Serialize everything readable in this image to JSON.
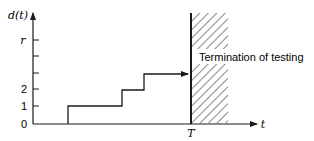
{
  "diagram": {
    "y_axis_label": "d(t)",
    "x_axis_label": "t",
    "y_ticks": [
      {
        "label": "r",
        "y": 40,
        "italic": true
      },
      {
        "label": "",
        "y": 56
      },
      {
        "label": "",
        "y": 73
      },
      {
        "label": "2",
        "y": 89
      },
      {
        "label": "1",
        "y": 106
      },
      {
        "label": "0",
        "y": 124
      }
    ],
    "termination_marker": "T",
    "annotation": "Termination of testing",
    "step_function": [
      {
        "x_start": 33,
        "x_end": 68,
        "level": 0
      },
      {
        "x_start": 68,
        "x_end": 122,
        "level": 1
      },
      {
        "x_start": 122,
        "x_end": 144,
        "level": 2
      },
      {
        "x_start": 144,
        "x_end": 190,
        "level": 3
      }
    ],
    "colors": {
      "line": "#1a1a1a",
      "background": "#ffffff"
    }
  }
}
